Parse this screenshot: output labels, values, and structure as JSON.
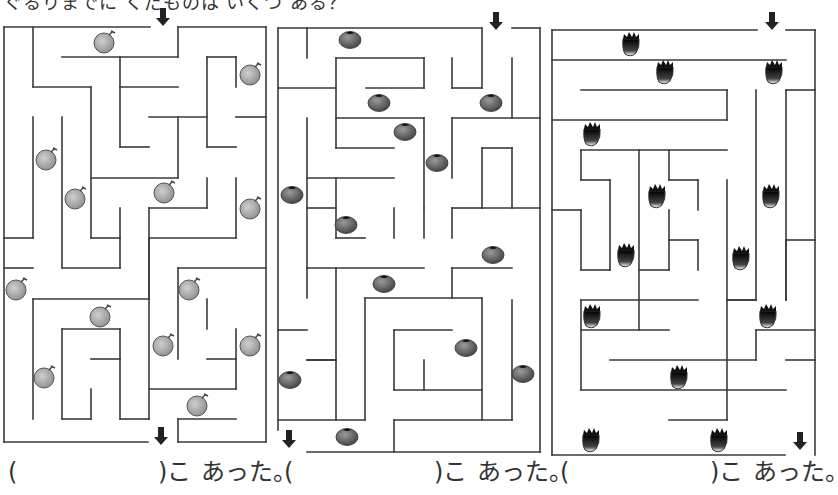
{
  "header": {
    "instruction": "ぐるりまでに くだものは いくつ ある？"
  },
  "colors": {
    "wall": "#3a3a3a",
    "arrow": "#222222",
    "melon": "#9a9a9a",
    "tomato": "#555555",
    "pineapple": "#1a1a1a"
  },
  "mazes": [
    {
      "name": "maze-melon",
      "fruit": "melon",
      "answer": {
        "open": "(",
        "close": ")こ",
        "suffix": "あった。",
        "left": 8
      },
      "start_arrow": {
        "x": 163,
        "y": 8
      },
      "end_arrow": {
        "x": 161,
        "y": 427
      },
      "walls": [
        [
          4,
          27,
          150,
          27
        ],
        [
          178,
          27,
          266,
          27
        ],
        [
          4,
          27,
          4,
          442
        ],
        [
          266,
          27,
          266,
          442
        ],
        [
          4,
          442,
          148,
          442
        ],
        [
          178,
          442,
          266,
          442
        ],
        [
          33,
          27,
          33,
          87
        ],
        [
          33,
          87,
          91,
          87
        ],
        [
          91,
          87,
          91,
          238
        ],
        [
          62,
          57,
          178,
          57
        ],
        [
          178,
          27,
          178,
          57
        ],
        [
          120,
          57,
          120,
          147
        ],
        [
          120,
          87,
          178,
          87
        ],
        [
          120,
          147,
          149,
          147
        ],
        [
          149,
          117,
          207,
          117
        ],
        [
          178,
          117,
          178,
          178
        ],
        [
          91,
          178,
          178,
          178
        ],
        [
          207,
          57,
          236,
          57
        ],
        [
          207,
          57,
          207,
          147
        ],
        [
          236,
          57,
          236,
          87
        ],
        [
          207,
          147,
          236,
          147
        ],
        [
          236,
          117,
          266,
          117
        ],
        [
          33,
          117,
          33,
          238
        ],
        [
          4,
          238,
          33,
          238
        ],
        [
          62,
          117,
          62,
          268
        ],
        [
          62,
          268,
          120,
          268
        ],
        [
          91,
          238,
          120,
          238
        ],
        [
          120,
          208,
          120,
          268
        ],
        [
          149,
          208,
          149,
          299
        ],
        [
          149,
          208,
          207,
          208
        ],
        [
          207,
          178,
          207,
          208
        ],
        [
          236,
          178,
          236,
          238
        ],
        [
          149,
          238,
          236,
          238
        ],
        [
          4,
          268,
          33,
          268
        ],
        [
          33,
          299,
          33,
          419
        ],
        [
          33,
          299,
          149,
          299
        ],
        [
          62,
          329,
          120,
          329
        ],
        [
          62,
          329,
          62,
          419
        ],
        [
          62,
          419,
          91,
          419
        ],
        [
          91,
          389,
          91,
          419
        ],
        [
          91,
          359,
          120,
          359
        ],
        [
          120,
          329,
          120,
          419
        ],
        [
          120,
          419,
          149,
          419
        ],
        [
          149,
          238,
          149,
          419
        ],
        [
          178,
          268,
          178,
          359
        ],
        [
          178,
          268,
          266,
          268
        ],
        [
          207,
          299,
          207,
          329
        ],
        [
          207,
          359,
          236,
          359
        ],
        [
          236,
          329,
          236,
          389
        ],
        [
          149,
          389,
          236,
          389
        ],
        [
          178,
          419,
          178,
          442
        ],
        [
          178,
          419,
          236,
          419
        ]
      ],
      "fruits": [
        [
          104,
          43
        ],
        [
          250,
          75
        ],
        [
          46,
          160
        ],
        [
          75,
          199
        ],
        [
          164,
          193
        ],
        [
          250,
          209
        ],
        [
          16,
          290
        ],
        [
          100,
          317
        ],
        [
          189,
          290
        ],
        [
          163,
          346
        ],
        [
          250,
          346
        ],
        [
          44,
          378
        ],
        [
          197,
          406
        ]
      ]
    },
    {
      "name": "maze-tomato",
      "fruit": "tomato",
      "answer": {
        "open": "(",
        "close": ")こ",
        "suffix": "あった。",
        "left": 284
      },
      "start_arrow": {
        "x": 496,
        "y": 12
      },
      "end_arrow": {
        "x": 289,
        "y": 430
      },
      "walls": [
        [
          278,
          28,
          482,
          28
        ],
        [
          512,
          28,
          540,
          28
        ],
        [
          278,
          28,
          278,
          430
        ],
        [
          540,
          28,
          540,
          452
        ],
        [
          307,
          452,
          540,
          452
        ],
        [
          307,
          28,
          307,
          58
        ],
        [
          278,
          88,
          336,
          88
        ],
        [
          336,
          58,
          336,
          148
        ],
        [
          336,
          58,
          424,
          58
        ],
        [
          424,
          58,
          424,
          88
        ],
        [
          366,
          88,
          424,
          88
        ],
        [
          452,
          58,
          452,
          88
        ],
        [
          452,
          88,
          482,
          88
        ],
        [
          482,
          28,
          482,
          88
        ],
        [
          512,
          58,
          512,
          118
        ],
        [
          336,
          118,
          424,
          118
        ],
        [
          424,
          118,
          424,
          208
        ],
        [
          336,
          148,
          394,
          148
        ],
        [
          307,
          118,
          307,
          268
        ],
        [
          307,
          178,
          394,
          178
        ],
        [
          307,
          208,
          336,
          208
        ],
        [
          336,
          178,
          336,
          238
        ],
        [
          336,
          238,
          365,
          238
        ],
        [
          394,
          208,
          394,
          238
        ],
        [
          424,
          208,
          424,
          238
        ],
        [
          452,
          118,
          540,
          118
        ],
        [
          452,
          118,
          452,
          178
        ],
        [
          482,
          148,
          512,
          148
        ],
        [
          482,
          148,
          482,
          208
        ],
        [
          512,
          148,
          512,
          208
        ],
        [
          482,
          208,
          540,
          208
        ],
        [
          452,
          208,
          482,
          208
        ],
        [
          452,
          208,
          452,
          238
        ],
        [
          307,
          268,
          424,
          268
        ],
        [
          336,
          268,
          336,
          420
        ],
        [
          307,
          268,
          307,
          298
        ],
        [
          278,
          330,
          307,
          330
        ],
        [
          307,
          360,
          336,
          360
        ],
        [
          307,
          360,
          336,
          360
        ],
        [
          365,
          298,
          482,
          298
        ],
        [
          365,
          298,
          365,
          420
        ],
        [
          452,
          268,
          512,
          268
        ],
        [
          452,
          268,
          452,
          298
        ],
        [
          394,
          330,
          452,
          330
        ],
        [
          394,
          330,
          394,
          390
        ],
        [
          424,
          360,
          424,
          390
        ],
        [
          394,
          390,
          482,
          390
        ],
        [
          482,
          298,
          482,
          420
        ],
        [
          512,
          300,
          512,
          420
        ],
        [
          278,
          420,
          365,
          420
        ],
        [
          394,
          420,
          512,
          420
        ],
        [
          394,
          420,
          394,
          452
        ]
      ],
      "fruits": [
        [
          350,
          40
        ],
        [
          379,
          103
        ],
        [
          491,
          103
        ],
        [
          405,
          132
        ],
        [
          437,
          163
        ],
        [
          292,
          195
        ],
        [
          346,
          225
        ],
        [
          493,
          255
        ],
        [
          384,
          284
        ],
        [
          466,
          348
        ],
        [
          290,
          380
        ],
        [
          523,
          374
        ],
        [
          347,
          437
        ]
      ]
    },
    {
      "name": "maze-pineapple",
      "fruit": "pineapple",
      "answer": {
        "open": "(",
        "close": ")こ",
        "suffix": "あった。",
        "left": 560
      },
      "start_arrow": {
        "x": 772,
        "y": 12
      },
      "end_arrow": {
        "x": 800,
        "y": 432
      },
      "walls": [
        [
          552,
          30,
          757,
          30
        ],
        [
          786,
          30,
          815,
          30
        ],
        [
          552,
          30,
          552,
          455
        ],
        [
          815,
          30,
          815,
          455
        ],
        [
          552,
          455,
          785,
          455
        ],
        [
          552,
          60,
          786,
          60
        ],
        [
          581,
          90,
          727,
          90
        ],
        [
          727,
          90,
          727,
          120
        ],
        [
          552,
          120,
          727,
          120
        ],
        [
          756,
          90,
          756,
          300
        ],
        [
          786,
          90,
          815,
          90
        ],
        [
          786,
          90,
          786,
          300
        ],
        [
          581,
          150,
          727,
          150
        ],
        [
          581,
          150,
          581,
          180
        ],
        [
          581,
          180,
          610,
          180
        ],
        [
          610,
          180,
          610,
          270
        ],
        [
          581,
          270,
          610,
          270
        ],
        [
          581,
          210,
          581,
          270
        ],
        [
          639,
          150,
          639,
          330
        ],
        [
          669,
          150,
          669,
          180
        ],
        [
          669,
          180,
          698,
          180
        ],
        [
          698,
          180,
          698,
          210
        ],
        [
          727,
          180,
          727,
          300
        ],
        [
          552,
          210,
          581,
          210
        ],
        [
          669,
          210,
          669,
          270
        ],
        [
          669,
          240,
          698,
          240
        ],
        [
          698,
          240,
          698,
          270
        ],
        [
          639,
          270,
          669,
          270
        ],
        [
          727,
          300,
          756,
          300
        ],
        [
          786,
          240,
          815,
          240
        ],
        [
          786,
          240,
          786,
          300
        ],
        [
          581,
          300,
          698,
          300
        ],
        [
          581,
          300,
          581,
          390
        ],
        [
          727,
          300,
          756,
          300
        ],
        [
          727,
          300,
          727,
          420
        ],
        [
          581,
          330,
          669,
          330
        ],
        [
          756,
          330,
          815,
          330
        ],
        [
          756,
          330,
          756,
          360
        ],
        [
          610,
          360,
          756,
          360
        ],
        [
          786,
          360,
          815,
          360
        ],
        [
          581,
          390,
          786,
          390
        ],
        [
          669,
          420,
          727,
          420
        ]
      ],
      "fruits": [
        [
          631,
          45
        ],
        [
          665,
          73
        ],
        [
          774,
          73
        ],
        [
          592,
          135
        ],
        [
          657,
          197
        ],
        [
          771,
          197
        ],
        [
          626,
          256
        ],
        [
          741,
          259
        ],
        [
          592,
          317
        ],
        [
          768,
          317
        ],
        [
          679,
          378
        ],
        [
          591,
          441
        ],
        [
          719,
          441
        ]
      ]
    }
  ]
}
